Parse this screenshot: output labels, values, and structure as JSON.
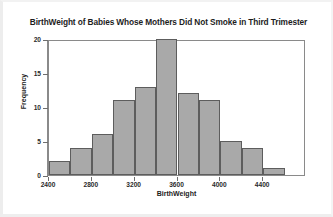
{
  "chart_data": {
    "type": "bar",
    "title": "BirthWeight of Babies Whose Mothers Did Not Smoke in Third Trimester",
    "xlabel": "BirthWeight",
    "ylabel": "Frequency",
    "bin_width": 200,
    "bin_starts": [
      2400,
      2600,
      2800,
      3000,
      3200,
      3400,
      3600,
      3800,
      4000,
      4200,
      4400
    ],
    "categories": [
      "2400-2600",
      "2600-2800",
      "2800-3000",
      "3000-3200",
      "3200-3400",
      "3400-3600",
      "3600-3800",
      "3800-4000",
      "4000-4200",
      "4200-4400",
      "4400-4600"
    ],
    "values": [
      2,
      4,
      6,
      11,
      13,
      20,
      12,
      11,
      5,
      4,
      1
    ],
    "xlim": [
      2400,
      4800
    ],
    "ylim": [
      0,
      20
    ],
    "x_ticks": [
      2400,
      2800,
      3200,
      3600,
      4000,
      4400
    ],
    "y_ticks": [
      0,
      5,
      10,
      15,
      20
    ],
    "grid": false,
    "legend": null,
    "bar_fill_color": "#a9a9a9",
    "bar_border_color": "#5d5d5d",
    "axis_color": "#8a8a8a",
    "background_color": "#ffffff"
  }
}
